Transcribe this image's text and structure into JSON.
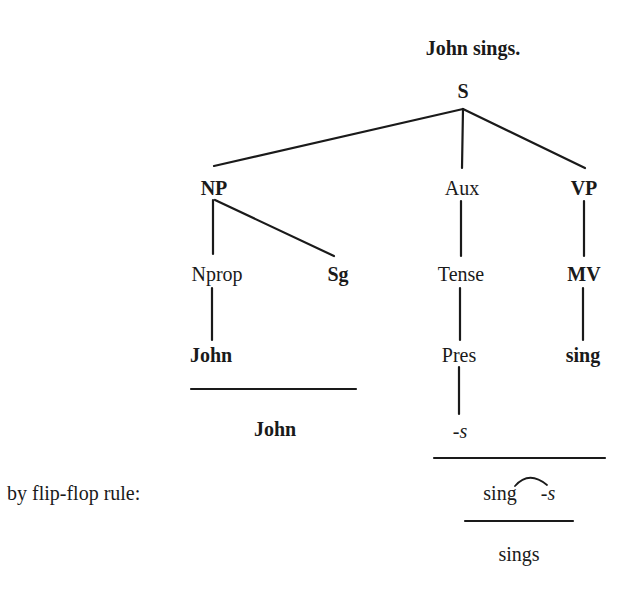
{
  "title": "John sings.",
  "tree": {
    "root": "S",
    "level1": {
      "np": "NP",
      "aux": "Aux",
      "vp": "VP"
    },
    "level2": {
      "nprop": "Nprop",
      "sg": "Sg",
      "tense": "Tense",
      "mv": "MV"
    },
    "level3": {
      "john": "John",
      "pres": "Pres",
      "sing": "sing"
    },
    "level4": {
      "s_suffix": "-s"
    }
  },
  "derivation": {
    "np_result": "John",
    "rule_label": "by flip-flop rule:",
    "flip_flop_stem": "sing",
    "flip_flop_suffix": "-s",
    "final_result": "sings"
  },
  "colors": {
    "ink": "#1a1a1a",
    "background": "#ffffff"
  }
}
